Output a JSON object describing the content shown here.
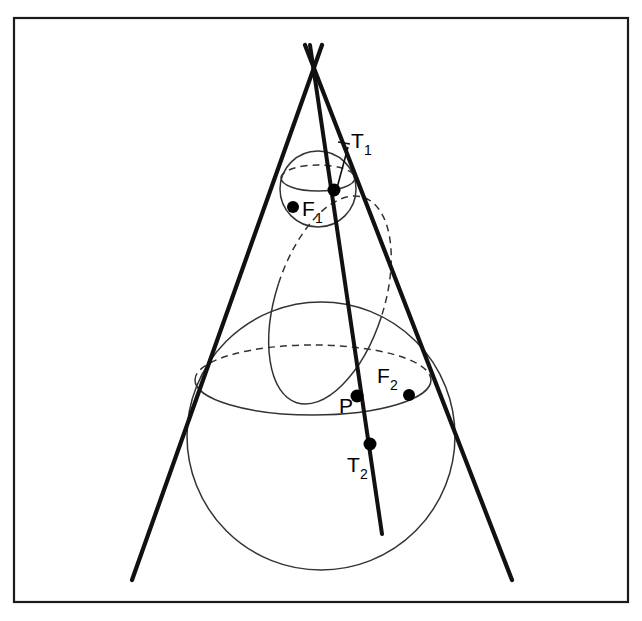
{
  "figure": {
    "background_color": "#ffffff",
    "ink_color": "#111111",
    "frame": {
      "x": 14,
      "y": 18,
      "width": 614,
      "height": 584
    }
  },
  "labels": {
    "t1": {
      "text": "T",
      "sub": "1",
      "x": 351,
      "y": 148
    },
    "f1": {
      "text": "F",
      "sub": "1",
      "x": 302,
      "y": 216
    },
    "f2": {
      "text": "F",
      "sub": "2",
      "x": 377,
      "y": 383
    },
    "p": {
      "text": "P",
      "sub": "",
      "x": 339,
      "y": 413
    },
    "t2": {
      "text": "T",
      "sub": "2",
      "x": 347,
      "y": 472
    }
  },
  "points": {
    "apex": {
      "x": 314,
      "y": 70,
      "r": 0
    },
    "t1_point": {
      "x": 334,
      "y": 190,
      "r": 6.5
    },
    "f1_point": {
      "x": 293,
      "y": 207,
      "r": 6.0
    },
    "p_point": {
      "x": 357,
      "y": 396,
      "r": 6.5
    },
    "f2_point": {
      "x": 409,
      "y": 395,
      "r": 6.0
    },
    "t2_point": {
      "x": 370,
      "y": 444,
      "r": 6.5
    }
  },
  "cone": {
    "apex_x": 314,
    "apex_y": 70,
    "left_generator": {
      "x1": 322,
      "y1": 45,
      "x2": 132,
      "y2": 580
    },
    "right_generator": {
      "x1": 305,
      "y1": 45,
      "x2": 512,
      "y2": 580
    }
  },
  "cutting_plane_line": {
    "x1": 310,
    "y1": 45,
    "x2": 382,
    "y2": 534
  },
  "spheres": [
    {
      "name": "upper-sphere",
      "cx": 318,
      "cy": 189,
      "r": 38
    },
    {
      "name": "lower-sphere",
      "cx": 321,
      "cy": 436,
      "r": 134
    }
  ],
  "contact_circles": [
    {
      "name": "upper-contact-circle",
      "cx": 318,
      "cy": 178,
      "rx": 37,
      "ry": 13,
      "rotation": 0
    },
    {
      "name": "lower-contact-circle",
      "cx": 313,
      "cy": 380,
      "rx": 118,
      "ry": 35,
      "rotation": 0
    }
  ],
  "conic_section": {
    "name": "ellipse-conic",
    "cx": 330,
    "cy": 300,
    "rx": 108,
    "ry": 54,
    "rotation": -72
  },
  "leader_line": {
    "x1": 348,
    "y1": 147,
    "x2": 337,
    "y2": 188
  },
  "glyph_names": {
    "point_marker": "filled-dot-marker",
    "dashed_arc": "hidden-edge-dashed-arc"
  }
}
